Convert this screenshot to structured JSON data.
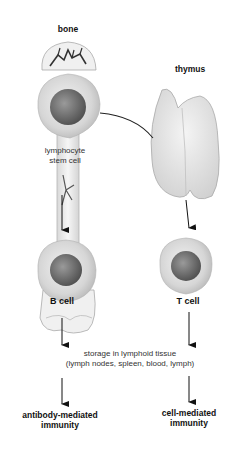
{
  "labels": {
    "bone": "bone",
    "thymus": "thymus",
    "stem_cell_line1": "lymphocyte",
    "stem_cell_line2": "stem cell",
    "b_cell": "B cell",
    "t_cell": "T cell",
    "storage_line1": "storage in lymphoid tissue",
    "storage_line2": "(lymph nodes, spleen, blood, lymph)",
    "antibody_line1": "antibody-mediated",
    "antibody_line2": "immunity",
    "cell_line1": "cell-mediated",
    "cell_line2": "immunity"
  },
  "colors": {
    "cell_body": "#d8d8d8",
    "nucleus": "#6a6a6a",
    "bone": "#eeeeee",
    "thymus": "#e6e6e6",
    "arrow": "#111111"
  }
}
